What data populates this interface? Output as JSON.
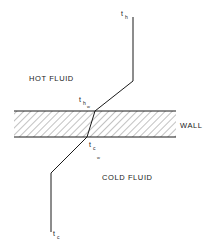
{
  "diagram": {
    "regions": {
      "hot_fluid": "HOT FLUID",
      "wall": "WALL",
      "cold_fluid": "COLD FLUID"
    },
    "temperatures": {
      "th": {
        "base": "t",
        "sub": "h"
      },
      "thw": {
        "base": "t",
        "sub": "h",
        "subsub": "w"
      },
      "tcw": {
        "base": "t",
        "sub": "c",
        "subsub": "w"
      },
      "tc": {
        "base": "t",
        "sub": "c"
      }
    },
    "colors": {
      "line": "#1a1a1a",
      "hatch": "#333333",
      "background": "#ffffff"
    }
  }
}
